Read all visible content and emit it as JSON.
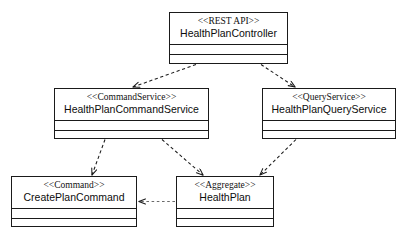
{
  "diagram": {
    "type": "uml-class-diagram",
    "background_color": "#ffffff",
    "line_color": "#1a1a1a",
    "classes": [
      {
        "id": "health-plan-controller",
        "stereotype": "<<REST API>>",
        "name": "HealthPlanController",
        "x": 169,
        "y": 12,
        "width": 119,
        "height": 52
      },
      {
        "id": "health-plan-command-service",
        "stereotype": "<<CommandService>>",
        "name": "HealthPlanCommandService",
        "x": 54,
        "y": 88,
        "width": 155,
        "height": 51
      },
      {
        "id": "health-plan-query-service",
        "stereotype": "<<QueryService>>",
        "name": "HealthPlanQueryService",
        "x": 262,
        "y": 88,
        "width": 134,
        "height": 51
      },
      {
        "id": "create-plan-command",
        "stereotype": "<<Command>>",
        "name": "CreatePlanCommand",
        "x": 11,
        "y": 176,
        "width": 126,
        "height": 51
      },
      {
        "id": "health-plan",
        "stereotype": "<<Aggregate>>",
        "name": "HealthPlan",
        "x": 176,
        "y": 176,
        "width": 98,
        "height": 51
      }
    ],
    "edges": [
      {
        "id": "controller-to-command-service",
        "kind": "dependency",
        "style": "dashed",
        "arrowhead": "open",
        "from": "health-plan-controller",
        "to": "health-plan-command-service",
        "points": "196,64 131,88"
      },
      {
        "id": "controller-to-query-service",
        "kind": "dependency",
        "style": "dashed",
        "arrowhead": "open",
        "from": "health-plan-controller",
        "to": "health-plan-query-service",
        "points": "261,64 296,88"
      },
      {
        "id": "command-service-to-create-plan-command",
        "kind": "dependency",
        "style": "dashed",
        "arrowhead": "open",
        "from": "health-plan-command-service",
        "to": "create-plan-command",
        "points": "104,139 91,176"
      },
      {
        "id": "command-service-to-health-plan",
        "kind": "dependency",
        "style": "dashed",
        "arrowhead": "open",
        "from": "health-plan-command-service",
        "to": "health-plan",
        "points": "163,139 204,176"
      },
      {
        "id": "query-service-to-health-plan",
        "kind": "dependency",
        "style": "dashed",
        "arrowhead": "open",
        "from": "health-plan-query-service",
        "to": "health-plan",
        "points": "295,139 259,176"
      },
      {
        "id": "health-plan-to-create-plan-command",
        "kind": "dependency",
        "style": "dashed",
        "arrowhead": "open",
        "from": "health-plan",
        "to": "create-plan-command",
        "points": "176,202 137,202"
      }
    ],
    "caption": ""
  }
}
